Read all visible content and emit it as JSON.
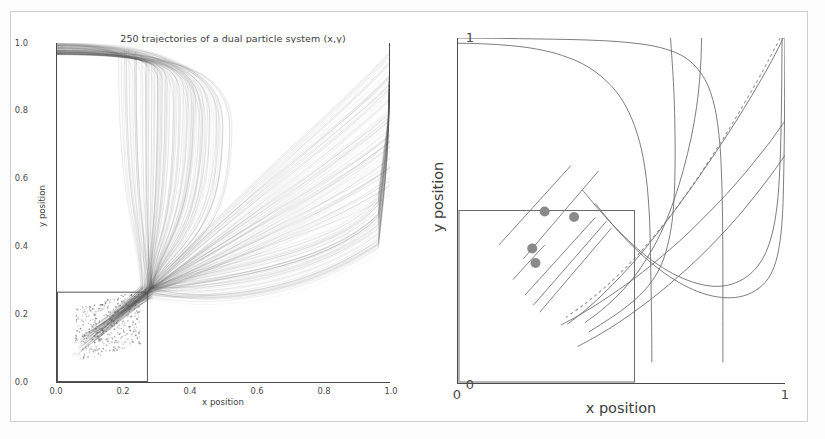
{
  "figure": {
    "background": "#ffffff",
    "border_color": "#cfcfcf"
  },
  "left_panel": {
    "title": "250 trajectories of a dual particle system (x,y)",
    "xlabel": "x position",
    "ylabel": "y position",
    "xticks": [
      "0.0",
      "0.2",
      "0.4",
      "0.6",
      "0.8",
      "1.0"
    ],
    "yticks": [
      "0.0",
      "0.2",
      "0.4",
      "0.6",
      "0.8",
      "1.0"
    ],
    "inset_rect_label": "zoom-region"
  },
  "right_panel": {
    "xlabel": "x position",
    "ylabel": "y position",
    "xticks": [
      "0",
      "1"
    ],
    "yticks": [
      "0",
      "1"
    ],
    "inset_rect_label": "zoom-region"
  },
  "chart_data": {
    "type": "line",
    "title": "250 trajectories of a dual particle system (x,y)",
    "xlabel": "x position",
    "ylabel": "y position",
    "xlim": [
      0.0,
      1.0
    ],
    "ylim": [
      0.0,
      1.0
    ],
    "grid": false,
    "legend": null,
    "n_trajectories": 250,
    "line_color": "#555555",
    "line_alpha": 0.18,
    "marker_color": "#8a8a8a",
    "focal_point": [
      0.27,
      0.265
    ],
    "inset_rect": {
      "x0": 0.0,
      "y0": 0.0,
      "x1": 0.27,
      "y1": 0.265
    },
    "seed_markers": [
      {
        "x": 0.265,
        "y": 0.497
      },
      {
        "x": 0.355,
        "y": 0.481
      },
      {
        "x": 0.227,
        "y": 0.39
      },
      {
        "x": 0.237,
        "y": 0.348
      }
    ],
    "representative_trajectories": [
      {
        "name": "traj-a",
        "style": "solid",
        "points": [
          [
            0.0,
            0.985
          ],
          [
            0.08,
            0.983
          ],
          [
            0.16,
            0.978
          ],
          [
            0.24,
            0.968
          ],
          [
            0.32,
            0.949
          ],
          [
            0.4,
            0.915
          ],
          [
            0.47,
            0.86
          ],
          [
            0.52,
            0.79
          ],
          [
            0.555,
            0.7
          ],
          [
            0.575,
            0.6
          ],
          [
            0.585,
            0.49
          ],
          [
            0.588,
            0.4
          ],
          [
            0.59,
            0.3
          ],
          [
            0.592,
            0.18
          ],
          [
            0.593,
            0.06
          ]
        ]
      },
      {
        "name": "traj-b",
        "style": "solid",
        "points": [
          [
            0.0,
            1.0
          ],
          [
            0.12,
            0.999
          ],
          [
            0.26,
            0.997
          ],
          [
            0.4,
            0.994
          ],
          [
            0.52,
            0.987
          ],
          [
            0.62,
            0.972
          ],
          [
            0.7,
            0.94
          ],
          [
            0.755,
            0.88
          ],
          [
            0.785,
            0.8
          ],
          [
            0.8,
            0.7
          ],
          [
            0.806,
            0.6
          ],
          [
            0.809,
            0.48
          ],
          [
            0.81,
            0.35
          ],
          [
            0.81,
            0.2
          ],
          [
            0.81,
            0.06
          ]
        ]
      },
      {
        "name": "traj-c",
        "style": "solid",
        "points": [
          [
            0.65,
            1.0
          ],
          [
            0.655,
            0.93
          ],
          [
            0.66,
            0.85
          ],
          [
            0.663,
            0.76
          ],
          [
            0.664,
            0.66
          ],
          [
            0.662,
            0.56
          ],
          [
            0.655,
            0.47
          ],
          [
            0.64,
            0.395
          ],
          [
            0.618,
            0.335
          ],
          [
            0.585,
            0.285
          ],
          [
            0.545,
            0.245
          ],
          [
            0.5,
            0.21
          ],
          [
            0.45,
            0.178
          ],
          [
            0.4,
            0.148
          ]
        ]
      },
      {
        "name": "traj-d",
        "style": "solid",
        "points": [
          [
            0.745,
            1.0
          ],
          [
            0.742,
            0.92
          ],
          [
            0.735,
            0.84
          ],
          [
            0.722,
            0.755
          ],
          [
            0.702,
            0.665
          ],
          [
            0.676,
            0.575
          ],
          [
            0.645,
            0.49
          ],
          [
            0.61,
            0.415
          ],
          [
            0.57,
            0.35
          ],
          [
            0.528,
            0.295
          ],
          [
            0.482,
            0.248
          ],
          [
            0.435,
            0.208
          ],
          [
            0.388,
            0.175
          ]
        ]
      },
      {
        "name": "traj-e",
        "style": "dashed",
        "points": [
          [
            0.985,
            1.0
          ],
          [
            0.952,
            0.94
          ],
          [
            0.915,
            0.875
          ],
          [
            0.872,
            0.805
          ],
          [
            0.825,
            0.73
          ],
          [
            0.775,
            0.655
          ],
          [
            0.722,
            0.58
          ],
          [
            0.668,
            0.508
          ],
          [
            0.612,
            0.44
          ],
          [
            0.556,
            0.378
          ],
          [
            0.5,
            0.322
          ],
          [
            0.443,
            0.272
          ],
          [
            0.386,
            0.228
          ],
          [
            0.33,
            0.19
          ]
        ]
      },
      {
        "name": "traj-f",
        "style": "solid",
        "points": [
          [
            0.995,
            1.0
          ],
          [
            0.96,
            0.935
          ],
          [
            0.92,
            0.868
          ],
          [
            0.876,
            0.798
          ],
          [
            0.828,
            0.726
          ],
          [
            0.777,
            0.653
          ],
          [
            0.724,
            0.58
          ],
          [
            0.669,
            0.508
          ],
          [
            0.613,
            0.438
          ],
          [
            0.557,
            0.372
          ],
          [
            0.5,
            0.312
          ],
          [
            0.444,
            0.258
          ],
          [
            0.388,
            0.21
          ],
          [
            0.334,
            0.17
          ]
        ]
      },
      {
        "name": "traj-g",
        "style": "solid",
        "points": [
          [
            1.0,
            0.76
          ],
          [
            0.955,
            0.7
          ],
          [
            0.905,
            0.64
          ],
          [
            0.852,
            0.58
          ],
          [
            0.796,
            0.522
          ],
          [
            0.738,
            0.466
          ],
          [
            0.678,
            0.412
          ],
          [
            0.617,
            0.362
          ],
          [
            0.556,
            0.315
          ],
          [
            0.494,
            0.272
          ],
          [
            0.433,
            0.233
          ],
          [
            0.373,
            0.198
          ],
          [
            0.315,
            0.168
          ]
        ]
      },
      {
        "name": "traj-h",
        "style": "solid",
        "points": [
          [
            1.0,
            0.66
          ],
          [
            0.955,
            0.6
          ],
          [
            0.906,
            0.54
          ],
          [
            0.854,
            0.48
          ],
          [
            0.798,
            0.422
          ],
          [
            0.74,
            0.366
          ],
          [
            0.679,
            0.313
          ],
          [
            0.617,
            0.263
          ],
          [
            0.554,
            0.217
          ],
          [
            0.491,
            0.175
          ],
          [
            0.428,
            0.138
          ],
          [
            0.366,
            0.106
          ]
        ]
      },
      {
        "name": "traj-i",
        "style": "solid",
        "points": [
          [
            0.42,
            0.52
          ],
          [
            0.47,
            0.462
          ],
          [
            0.522,
            0.408
          ],
          [
            0.576,
            0.36
          ],
          [
            0.632,
            0.318
          ],
          [
            0.69,
            0.284
          ],
          [
            0.748,
            0.26
          ],
          [
            0.806,
            0.248
          ],
          [
            0.862,
            0.25
          ],
          [
            0.91,
            0.268
          ],
          [
            0.948,
            0.302
          ],
          [
            0.972,
            0.352
          ],
          [
            0.986,
            0.42
          ],
          [
            0.993,
            0.5
          ],
          [
            0.996,
            0.6
          ],
          [
            0.998,
            0.72
          ],
          [
            0.999,
            0.86
          ],
          [
            1.0,
            1.0
          ]
        ]
      },
      {
        "name": "traj-j",
        "style": "solid",
        "points": [
          [
            0.38,
            0.56
          ],
          [
            0.435,
            0.498
          ],
          [
            0.492,
            0.44
          ],
          [
            0.55,
            0.388
          ],
          [
            0.61,
            0.344
          ],
          [
            0.672,
            0.31
          ],
          [
            0.734,
            0.288
          ],
          [
            0.794,
            0.28
          ],
          [
            0.848,
            0.29
          ],
          [
            0.896,
            0.318
          ],
          [
            0.934,
            0.364
          ],
          [
            0.96,
            0.43
          ],
          [
            0.976,
            0.516
          ],
          [
            0.984,
            0.62
          ],
          [
            0.988,
            0.74
          ],
          [
            0.99,
            0.87
          ],
          [
            0.991,
            1.0
          ]
        ]
      }
    ]
  }
}
